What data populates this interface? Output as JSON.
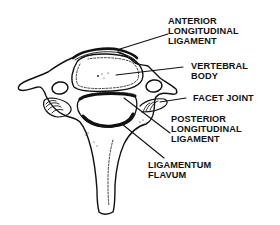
{
  "diagram": {
    "colors": {
      "ink": "#111111",
      "background": "#ffffff"
    },
    "labels": [
      {
        "id": "anterior-longitudinal-ligament",
        "lines": [
          "ANTERIOR",
          "LONGITUDINAL",
          "LIGAMENT"
        ]
      },
      {
        "id": "vertebral-body",
        "lines": [
          "VERTEBRAL",
          "BODY"
        ]
      },
      {
        "id": "facet-joint",
        "lines": [
          "FACET JOINT"
        ]
      },
      {
        "id": "posterior-longitudinal-ligament",
        "lines": [
          "POSTERIOR",
          "LONGITUDINAL",
          "LIGAMENT"
        ]
      },
      {
        "id": "ligamentum-flavum",
        "lines": [
          "LIGAMENTUM",
          "FLAVUM"
        ]
      }
    ]
  }
}
